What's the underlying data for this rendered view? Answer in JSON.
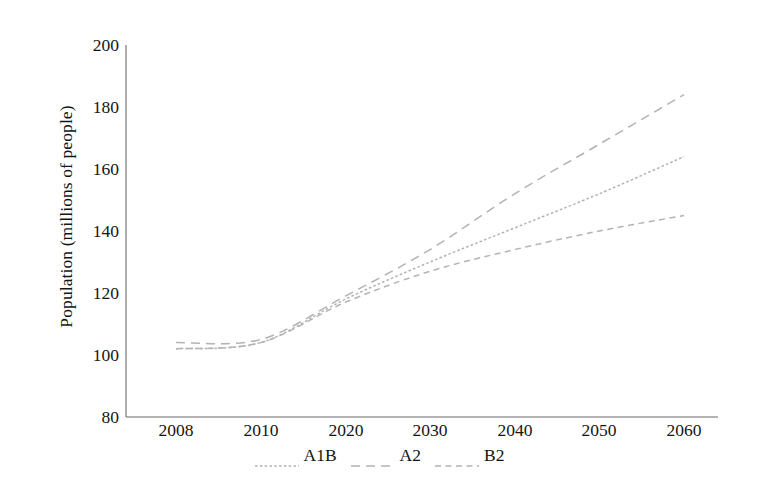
{
  "chart_data": {
    "type": "line",
    "title": "",
    "xlabel": "",
    "ylabel": "Population (millions of people)",
    "x": [
      "2008",
      "2010",
      "2020",
      "2030",
      "2040",
      "2050",
      "2060"
    ],
    "xtick_labels": [
      "2008",
      "2010",
      "2020",
      "2030",
      "2040",
      "2050",
      "2060"
    ],
    "ytick_labels": [
      "80",
      "100",
      "120",
      "140",
      "160",
      "180",
      "200"
    ],
    "ylim": [
      80,
      200
    ],
    "ytick_values": [
      80,
      100,
      120,
      140,
      160,
      180,
      200
    ],
    "grid": false,
    "legend_position": "bottom-center",
    "series": [
      {
        "name": "A1B",
        "style": "dotted",
        "color": "#b3b3b3",
        "values": [
          102,
          104,
          118,
          130,
          141,
          152,
          164
        ]
      },
      {
        "name": "A2",
        "style": "dashed-long",
        "color": "#b3b3b3",
        "values": [
          104,
          105,
          119,
          134,
          152,
          168,
          184
        ]
      },
      {
        "name": "B2",
        "style": "dashed",
        "color": "#b3b3b3",
        "values": [
          102,
          104,
          117,
          127,
          134,
          140,
          145
        ]
      }
    ],
    "axis_color": "#6b6b6b",
    "line_color": "#b3b3b3"
  },
  "legend": {
    "items": [
      {
        "label": "A1B"
      },
      {
        "label": "A2"
      },
      {
        "label": "B2"
      }
    ]
  }
}
